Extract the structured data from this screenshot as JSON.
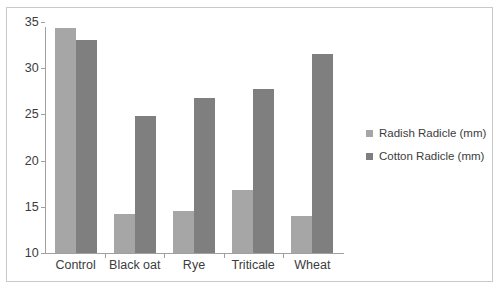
{
  "chart_data": {
    "type": "bar",
    "title": "",
    "subtitle": "",
    "xlabel": "",
    "ylabel": "",
    "categories": [
      "Control",
      "Black oat",
      "Rye",
      "Triticale",
      "Wheat"
    ],
    "series": [
      {
        "name": "Radish Radicle (mm)",
        "color": "#a6a6a6",
        "values": [
          34.3,
          14.2,
          14.5,
          16.8,
          14.0
        ]
      },
      {
        "name": "Cotton Radicle (mm)",
        "color": "#7f7f7f",
        "values": [
          33.1,
          24.8,
          26.8,
          27.7,
          31.5
        ]
      }
    ],
    "ylim": [
      10,
      35
    ],
    "yticks": [
      10,
      15,
      20,
      25,
      30,
      35
    ],
    "ytick_labels": [
      "10",
      "15",
      "20",
      "25",
      "30",
      "35"
    ],
    "grid": false,
    "legend_position": "right",
    "axis_color": "#a0a0a0",
    "background_color": "#ffffff",
    "border_color": "#c9c9c9"
  }
}
